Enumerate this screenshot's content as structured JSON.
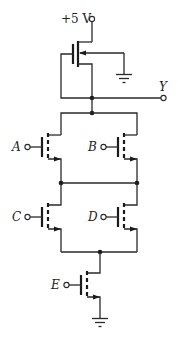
{
  "diagram": {
    "type": "NMOS logic gate schematic (depletion load)",
    "supply_label": "+5 V",
    "output_label": "Y",
    "inputs": [
      {
        "name": "A"
      },
      {
        "name": "B"
      },
      {
        "name": "C"
      },
      {
        "name": "D"
      },
      {
        "name": "E"
      }
    ],
    "topology": "Y = NOT(((A OR B) AND (C OR D)) AND E)"
  }
}
